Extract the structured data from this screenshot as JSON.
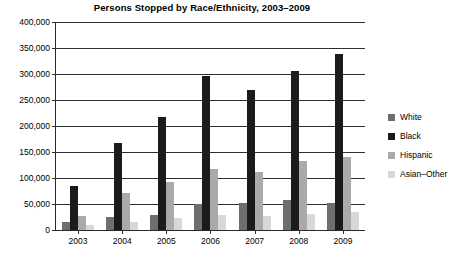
{
  "chart_data": {
    "type": "bar",
    "title": "Persons Stopped by Race/Ethnicity, 2003–2009",
    "xlabel": "",
    "ylabel": "",
    "ylim": [
      0,
      400000
    ],
    "ytick_labels": [
      "400,000",
      "350,000",
      "300,000",
      "250,000",
      "200,000",
      "150,000",
      "100,000",
      "50,000",
      "0"
    ],
    "ytick_values": [
      400000,
      350000,
      300000,
      250000,
      200000,
      150000,
      100000,
      50000,
      0
    ],
    "grid": true,
    "legend_position": "right",
    "categories": [
      "2003",
      "2004",
      "2005",
      "2006",
      "2007",
      "2008",
      "2009"
    ],
    "series": [
      {
        "name": "White",
        "color": "#6e6e6e",
        "values": [
          15000,
          25000,
          28000,
          50000,
          51000,
          57000,
          52000
        ]
      },
      {
        "name": "Black",
        "color": "#1b1b1b",
        "values": [
          85000,
          167000,
          217000,
          296000,
          269000,
          305000,
          338000
        ]
      },
      {
        "name": "Hispanic",
        "color": "#aaaaaa",
        "values": [
          27000,
          72000,
          92000,
          118000,
          112000,
          133000,
          141000
        ]
      },
      {
        "name": "Asian–Other",
        "color": "#d8d8d8",
        "values": [
          9000,
          15000,
          23000,
          29000,
          26000,
          31000,
          35000
        ]
      }
    ]
  }
}
